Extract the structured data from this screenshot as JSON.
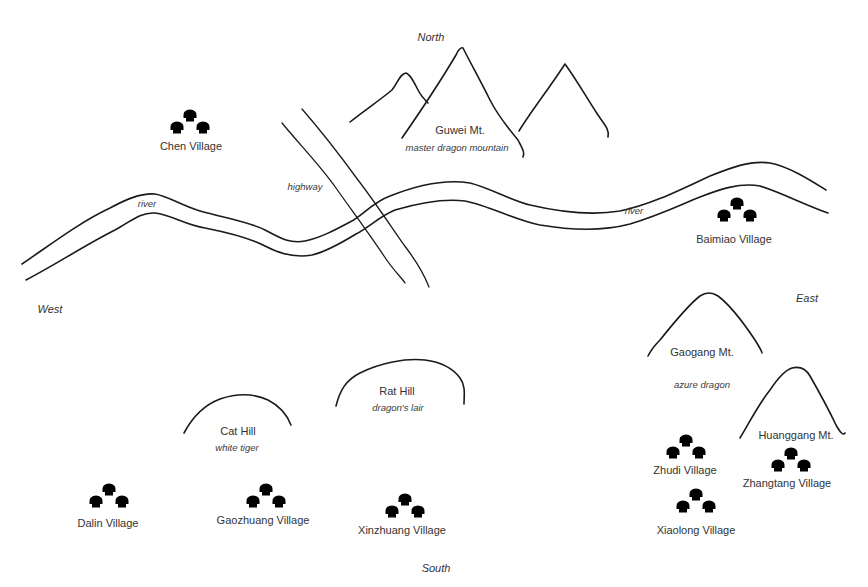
{
  "map": {
    "directions": {
      "north": "North",
      "south": "South",
      "east": "East",
      "west": "West"
    },
    "features": {
      "guwei": {
        "name": "Guwei Mt.",
        "subtitle": "master dragon mountain"
      },
      "gaogang": {
        "name": "Gaogang Mt.",
        "subtitle": "azure dragon"
      },
      "huanggang": {
        "name": "Huanggang Mt."
      },
      "cat_hill": {
        "name": "Cat Hill",
        "subtitle": "white tiger"
      },
      "rat_hill": {
        "name": "Rat Hill",
        "subtitle": "dragon's lair"
      },
      "river_label_west": "river",
      "river_label_east": "river",
      "highway_label": "highway"
    },
    "villages": [
      {
        "id": "chen",
        "name": "Chen Village"
      },
      {
        "id": "baimiao",
        "name": "Baimiao Village"
      },
      {
        "id": "dalin",
        "name": "Dalin Village"
      },
      {
        "id": "gaozhuang",
        "name": "Gaozhuang Village"
      },
      {
        "id": "xinzhuang",
        "name": "Xinzhuang Village"
      },
      {
        "id": "zhudi",
        "name": "Zhudi Village"
      },
      {
        "id": "zhangtang",
        "name": "Zhangtang Village"
      },
      {
        "id": "xiaolong",
        "name": "Xiaolong Village"
      }
    ],
    "icons": {
      "village": "hut-cluster-icon",
      "mountain": "mountain-outline",
      "river": "river-banks",
      "road": "highway-lines"
    }
  }
}
